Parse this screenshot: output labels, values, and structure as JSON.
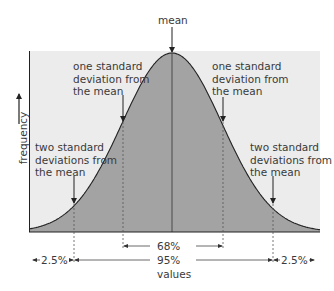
{
  "chart_data": {
    "type": "area",
    "xlabel": "values",
    "ylabel": "frequency",
    "distribution": "normal",
    "mean_label": "mean",
    "annotations": [
      {
        "id": "mean",
        "text": "mean",
        "position_sd": 0
      },
      {
        "id": "minus1sd",
        "text": "one standard deviation from the mean",
        "position_sd": -1
      },
      {
        "id": "plus1sd",
        "text": "one standard deviation from the mean",
        "position_sd": 1
      },
      {
        "id": "minus2sd",
        "text": "two standard deviations from the mean",
        "position_sd": -2
      },
      {
        "id": "plus2sd",
        "text": "two standard deviations from the mean",
        "position_sd": 2
      }
    ],
    "ranges": [
      {
        "label": "68%",
        "from_sd": -1,
        "to_sd": 1,
        "value": 68
      },
      {
        "label": "95%",
        "from_sd": -2,
        "to_sd": 2,
        "value": 95
      },
      {
        "label": "2.5%",
        "from_sd": -3,
        "to_sd": -2,
        "value": 2.5
      },
      {
        "label": "2.5%",
        "from_sd": 2,
        "to_sd": 3,
        "value": 2.5
      }
    ],
    "grid": false,
    "colors": {
      "fill": "#a3a3a3",
      "background": "#ececec",
      "line": "#222222"
    }
  },
  "labels": {
    "mean": "mean",
    "one_sd_left": "one standard\ndeviation from\nthe mean",
    "one_sd_right": "one standard\ndeviation from\nthe mean",
    "two_sd_left": "two standard\ndeviations from\nthe mean",
    "two_sd_right": "two standard\ndeviations from\nthe mean",
    "frequency": "frequency",
    "values": "values",
    "pct_68": "68%",
    "pct_95": "95%",
    "pct_left": "2.5%",
    "pct_right": "2.5%"
  }
}
